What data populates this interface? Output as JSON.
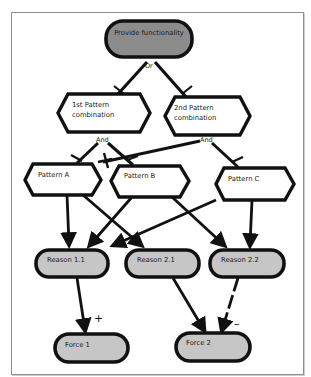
{
  "diagram": {
    "colors": {
      "goal_fill": "#8c8c8c",
      "reason_fill": "#c6c6c6",
      "force_fill": "#c6c6c6",
      "pattern_fill": "#ffffff",
      "stroke": "#111111",
      "frame": "#8d8d8d"
    },
    "goal": {
      "label": "Provide functionality"
    },
    "decomposition_labels": {
      "or": "Or",
      "and_1": "And",
      "and_2": "And"
    },
    "combinations": [
      {
        "label_line1": "1st Pattern",
        "label_line2": "combination"
      },
      {
        "label_line1": "2nd Pattern",
        "label_line2": "combination"
      }
    ],
    "patterns": [
      {
        "label": "Pattern A"
      },
      {
        "label": "Pattern B"
      },
      {
        "label": "Pattern C"
      }
    ],
    "reasons": [
      {
        "label": "Reason 1.1"
      },
      {
        "label": "Reason 2.1"
      },
      {
        "label": "Reason 2.2"
      }
    ],
    "forces": [
      {
        "label": "Force 1"
      },
      {
        "label": "Force 2"
      }
    ],
    "contribution_labels": {
      "positive": "+",
      "negative": "–"
    },
    "edges": [
      {
        "from": "Provide functionality",
        "to": "1st Pattern combination",
        "type": "or"
      },
      {
        "from": "Provide functionality",
        "to": "2nd Pattern combination",
        "type": "or"
      },
      {
        "from": "1st Pattern combination",
        "to": "Pattern A",
        "type": "and"
      },
      {
        "from": "1st Pattern combination",
        "to": "Pattern B",
        "type": "and"
      },
      {
        "from": "2nd Pattern combination",
        "to": "Pattern B",
        "type": "and"
      },
      {
        "from": "2nd Pattern combination",
        "to": "Pattern C",
        "type": "and"
      },
      {
        "from": "Pattern A",
        "to": "Reason 1.1",
        "type": "arrow"
      },
      {
        "from": "Pattern A",
        "to": "Reason 2.1",
        "type": "arrow"
      },
      {
        "from": "Pattern B",
        "to": "Reason 1.1",
        "type": "arrow"
      },
      {
        "from": "Pattern B",
        "to": "Reason 2.2",
        "type": "arrow"
      },
      {
        "from": "Pattern C",
        "to": "Reason 1.1",
        "type": "arrow"
      },
      {
        "from": "Pattern C",
        "to": "Reason 2.2",
        "type": "arrow"
      },
      {
        "from": "Reason 1.1",
        "to": "Force 1",
        "type": "positive"
      },
      {
        "from": "Reason 2.1",
        "to": "Force 2",
        "type": "arrow"
      },
      {
        "from": "Reason 2.2",
        "to": "Force 2",
        "type": "negative-dashed"
      }
    ]
  }
}
